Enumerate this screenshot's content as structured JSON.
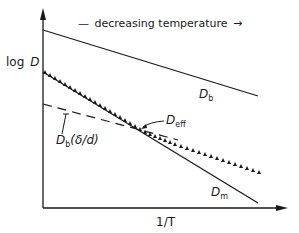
{
  "diagram": {
    "y_axis_label_prefix": "log",
    "y_axis_label_var": "D",
    "x_axis_label": "1/T",
    "header_annotation": "— decreasing temperature →",
    "header_dash": "—",
    "header_text": "decreasing temperature",
    "header_arrow": "→",
    "curves": [
      {
        "name": "D_b",
        "label_main": "D",
        "label_sub": "b",
        "style": "solid"
      },
      {
        "name": "D_m",
        "label_main": "D",
        "label_sub": "m",
        "style": "solid"
      },
      {
        "name": "D_b(δ/d)",
        "label_main": "D",
        "label_sub": "b",
        "label_suffix": "(δ/d)",
        "style": "dashed"
      },
      {
        "name": "D_eff",
        "label_main": "D",
        "label_sub": "eff",
        "style": "dotted-triangles"
      }
    ],
    "colors": {
      "ink": "#1a1a1a",
      "background": "#ffffff"
    }
  }
}
